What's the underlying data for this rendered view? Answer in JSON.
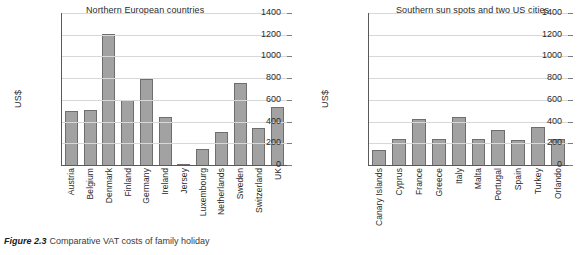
{
  "caption": {
    "number": "Figure 2.3",
    "text": "Comparative VAT costs of family holiday"
  },
  "colors": {
    "bar_fill": "#a2a2a2",
    "bar_border": "#6e6e6e",
    "axis": "#5a5a5a",
    "grid": "#d8d8d8",
    "text": "#2b2b2b",
    "background": "#ffffff"
  },
  "chart_data": [
    {
      "type": "bar",
      "title": "Northern European countries",
      "xlabel": "",
      "ylabel": "US$",
      "ylim": [
        0,
        1400
      ],
      "yticks": [
        0,
        200,
        400,
        600,
        800,
        1000,
        1200,
        1400
      ],
      "grid": true,
      "legend": null,
      "categories": [
        "Austria",
        "Belgium",
        "Denmark",
        "Finland",
        "Germany",
        "Ireland",
        "Jersey",
        "Luxembourg",
        "Netherlands",
        "Sweden",
        "Switzerland",
        "UK"
      ],
      "values": [
        500,
        505,
        1210,
        595,
        790,
        440,
        12,
        150,
        300,
        760,
        340,
        530
      ]
    },
    {
      "type": "bar",
      "title": "Southern sun spots and two US cities",
      "xlabel": "",
      "ylabel": "US$",
      "ylim": [
        0,
        1400
      ],
      "yticks": [
        0,
        200,
        400,
        600,
        800,
        1000,
        1200,
        1400
      ],
      "grid": true,
      "legend": null,
      "categories": [
        "Canary Islands",
        "Cyprus",
        "France",
        "Greece",
        "Italy",
        "Malta",
        "Portugal",
        "Spain",
        "Turkey",
        "Orlando"
      ],
      "values": [
        140,
        240,
        425,
        240,
        445,
        240,
        325,
        230,
        350,
        240
      ]
    }
  ]
}
